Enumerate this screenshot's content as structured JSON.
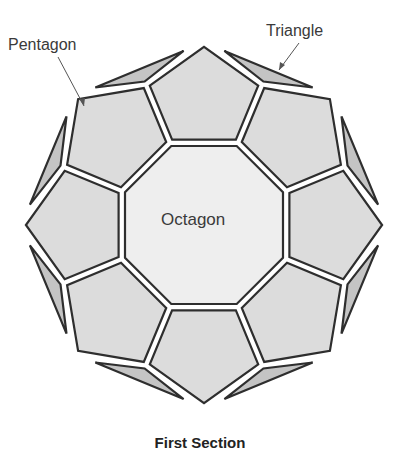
{
  "diagram": {
    "labels": {
      "pentagon": "Pentagon",
      "triangle": "Triangle",
      "octagon": "Octagon"
    },
    "caption": "First Section",
    "colors": {
      "background": "#ffffff",
      "octagon_fill": "#eeeeee",
      "pentagon_fill": "#dcdcdc",
      "triangle_fill": "#c4c4c4",
      "stroke": "#2e2e2e",
      "text": "#3a3a3a"
    },
    "geometry": {
      "center": [
        204,
        225
      ],
      "octagon_vertex_radius": 89,
      "junction_radius": 152,
      "apex_radius": 182,
      "triangle_outer_radius": 186,
      "gap": 3.2,
      "count": 8
    },
    "shapes": {
      "octagon_count": 1,
      "pentagon_count": 8,
      "triangle_count": 8
    }
  }
}
